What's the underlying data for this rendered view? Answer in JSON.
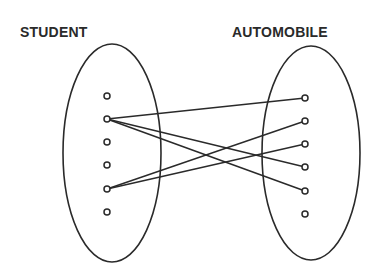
{
  "diagram": {
    "type": "set-mapping",
    "left_set": {
      "label": "STUDENT",
      "ellipse": {
        "cx": 112,
        "cy": 153,
        "rx": 49,
        "ry": 109
      },
      "nodes": [
        {
          "id": "s1",
          "x": 107,
          "y": 96
        },
        {
          "id": "s2",
          "x": 107,
          "y": 119
        },
        {
          "id": "s3",
          "x": 107,
          "y": 142
        },
        {
          "id": "s4",
          "x": 107,
          "y": 165
        },
        {
          "id": "s5",
          "x": 107,
          "y": 189
        },
        {
          "id": "s6",
          "x": 107,
          "y": 212
        }
      ]
    },
    "right_set": {
      "label": "AUTOMOBILE",
      "ellipse": {
        "cx": 311,
        "cy": 153,
        "rx": 49,
        "ry": 107
      },
      "nodes": [
        {
          "id": "a1",
          "x": 305,
          "y": 98
        },
        {
          "id": "a2",
          "x": 305,
          "y": 121
        },
        {
          "id": "a3",
          "x": 305,
          "y": 144
        },
        {
          "id": "a4",
          "x": 305,
          "y": 167
        },
        {
          "id": "a5",
          "x": 305,
          "y": 191
        },
        {
          "id": "a6",
          "x": 305,
          "y": 214
        }
      ]
    },
    "edges": [
      {
        "from": "s2",
        "to": "a1"
      },
      {
        "from": "s2",
        "to": "a4"
      },
      {
        "from": "s2",
        "to": "a5"
      },
      {
        "from": "s5",
        "to": "a2"
      },
      {
        "from": "s5",
        "to": "a3"
      }
    ],
    "colors": {
      "stroke": "#2a2a2a",
      "background": "#ffffff"
    }
  }
}
